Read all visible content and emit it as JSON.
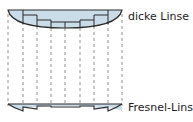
{
  "labels": {
    "thick_lens": "dicke Linse",
    "fresnel_lens": "Fresnel-Linse"
  },
  "colors": {
    "lens_fill": "#c9dce8",
    "outline": "#2a2a2a",
    "dash": "#777777"
  },
  "dashed_lines_x": [
    8,
    23,
    37,
    51,
    65,
    80,
    94,
    108,
    122
  ]
}
